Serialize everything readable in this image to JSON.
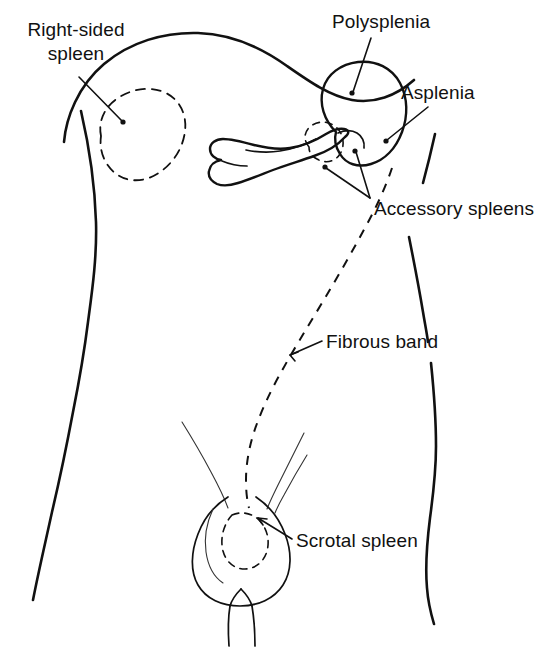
{
  "figure": {
    "caption": "",
    "background_color": "#ffffff",
    "ink_color": "#111111"
  },
  "labels": {
    "right_sided_spleen": "Right-sided\nspleen",
    "right_sided_spleen_line1": "Right-sided",
    "right_sided_spleen_line2": "spleen",
    "polysplenia": "Polysplenia",
    "asplenia": "Asplenia",
    "accessory_spleens": "Accessory spleens",
    "fibrous_band": "Fibrous band",
    "scrotal_spleen": "Scrotal spleen"
  },
  "anatomy": {
    "torso_outline": "abdominal trunk silhouette",
    "diaphragm": "diaphragm dome curve",
    "spleen": "normally positioned left upper quadrant spleen",
    "pancreas": "pancreas body and tail",
    "ghost_right_spleen": "dashed right-sided spleen outline",
    "ghost_accessory_spleen": "dashed accessory spleen near pancreatic tail",
    "ghost_scrotal_spleen": "dashed scrotal spleen outline",
    "fibrous_band_path": "dashed band from splenic hilum to scrotum",
    "scrotum": "scrotum and penis outline",
    "inguinal_lines": "inguinal ligament / groin crease lines"
  },
  "leaders": {
    "right_sided_spleen": "line from label to dashed right spleen",
    "polysplenia": "line from label to spleen body",
    "asplenia": "line from label to splenic bed",
    "accessory_spleens": "two lines from label to hilar accessory spleens",
    "fibrous_band": "line from label to dashed band",
    "scrotal_spleen": "line from label to scrotal spleen"
  }
}
